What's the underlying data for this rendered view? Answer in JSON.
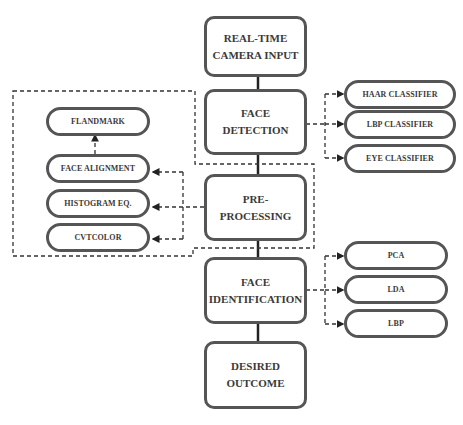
{
  "diagram": {
    "type": "flowchart",
    "main_flow": [
      {
        "id": "camera",
        "line1": "REAL-TIME",
        "line2": "CAMERA INPUT"
      },
      {
        "id": "detection",
        "line1": "FACE",
        "line2": "DETECTION"
      },
      {
        "id": "preprocessing",
        "line1": "PRE-",
        "line2": "PROCESSING"
      },
      {
        "id": "identification",
        "line1": "FACE",
        "line2": "IDENTIFICATION"
      },
      {
        "id": "outcome",
        "line1": "DESIRED",
        "line2": "OUTCOME"
      }
    ],
    "detection_methods": [
      "HAAR CLASSIFIER",
      "LBP CLASSIFIER",
      "EYE CLASSIFIER"
    ],
    "preprocessing_steps": [
      "FLANDMARK",
      "FACE ALIGNMENT",
      "HISTOGRAM EQ.",
      "CVTCOLOR"
    ],
    "identification_methods": [
      "PCA",
      "LDA",
      "LBP"
    ],
    "colors": {
      "border": "#555555",
      "text": "#3a3a3a",
      "connector": "#222222",
      "background": "#ffffff"
    }
  }
}
